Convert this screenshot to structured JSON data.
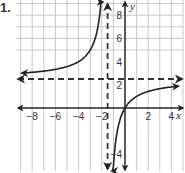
{
  "problem_number": "1.",
  "chart_data": {
    "type": "line",
    "title": "",
    "xlabel": "x",
    "ylabel": "y",
    "xlim": [
      -9,
      4.9
    ],
    "ylim": [
      -5.6,
      9.2
    ],
    "grid": true,
    "x_ticks": [
      -8,
      -6,
      -4,
      -2,
      2,
      4
    ],
    "x_tick_labels": [
      "−8",
      "−6",
      "−4",
      "−2",
      "2",
      "4"
    ],
    "y_ticks": [
      8,
      6,
      4,
      2,
      -4
    ],
    "y_tick_labels": [
      "8",
      "6",
      "4",
      "2",
      "−4"
    ],
    "function": "f(x) = 2.5x / (x + 1.5)",
    "asymptotes": {
      "vertical": {
        "x": -1.5,
        "style": "dashed"
      },
      "horizontal": {
        "y": 2.5,
        "style": "dashed"
      }
    },
    "series": [
      {
        "name": "left branch",
        "x": [
          -8.9,
          -8,
          -6,
          -4,
          -3,
          -2.5,
          -2.2,
          -2.0,
          -1.9
        ],
        "y": [
          3.01,
          3.08,
          3.33,
          4.0,
          5.0,
          6.25,
          7.86,
          10.0,
          11.9
        ]
      },
      {
        "name": "right branch",
        "x": [
          -1.15,
          -1.0,
          -0.75,
          -0.5,
          0,
          1,
          2,
          3,
          4,
          4.6
        ],
        "y": [
          -8.2,
          -5.0,
          -2.5,
          -1.25,
          0,
          1.0,
          1.43,
          1.67,
          1.82,
          1.89
        ]
      }
    ],
    "colors": {
      "curve": "#222222",
      "grid": "#c8c8c8",
      "axis": "#222222",
      "asymptote": "#333333"
    }
  }
}
